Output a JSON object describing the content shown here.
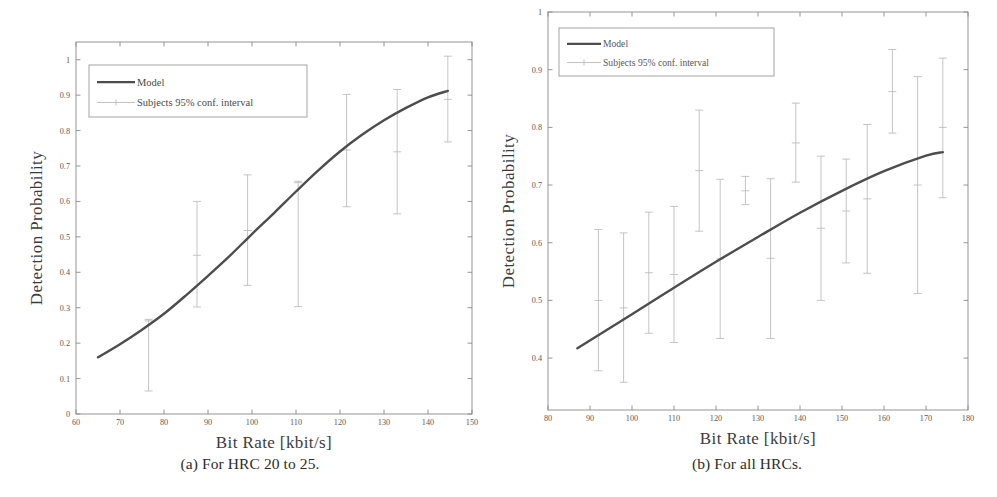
{
  "figure": {
    "panels": [
      {
        "id": "panel-a",
        "caption": "(a) For HRC 20 to 25.",
        "caption_index": "(a)",
        "caption_text": "For HRC 20 to 25."
      },
      {
        "id": "panel-b",
        "caption": "(b) For all HRCs.",
        "caption_index": "(b)",
        "caption_text": "For all HRCs."
      }
    ],
    "colors": {
      "model_line": "#4d4d4d",
      "errorbar": "#b9b9b9",
      "axis": "#8a8a8a",
      "text": "#4a4a4a",
      "background": "#ffffff",
      "legend_border": "#9a9a9a"
    }
  },
  "chart_data": [
    {
      "type": "line",
      "id": "chart-a",
      "title": "(a) For HRC 20 to 25.",
      "xlabel": "Bit Rate [kbit/s]",
      "ylabel": "Detection Probability",
      "xlim": [
        60,
        150
      ],
      "ylim": [
        0,
        1.05
      ],
      "xticks": [
        60,
        70,
        80,
        90,
        100,
        110,
        120,
        130,
        140,
        150
      ],
      "xtick_labels": [
        "60",
        "70",
        "80",
        "90",
        "100",
        "110",
        "120",
        "130",
        "140",
        "150"
      ],
      "yticks": [
        0,
        0.1,
        0.2,
        0.3,
        0.4,
        0.5,
        0.6,
        0.7,
        0.8,
        0.9,
        1
      ],
      "ytick_labels": [
        "0",
        "0.1",
        "0.2",
        "0.3",
        "0.4",
        "0.5",
        "0.6",
        "0.7",
        "0.8",
        "0.9",
        "1"
      ],
      "grid": false,
      "legend_position": "upper left",
      "legend": [
        "Model",
        "Subjects 95% conf. interval"
      ],
      "series": [
        {
          "name": "Model",
          "style": "line",
          "x": [
            65,
            70,
            75,
            80,
            85,
            90,
            95,
            100,
            105,
            110,
            115,
            120,
            125,
            130,
            135,
            140,
            144.5
          ],
          "values": [
            0.16,
            0.197,
            0.238,
            0.283,
            0.335,
            0.39,
            0.447,
            0.508,
            0.567,
            0.628,
            0.687,
            0.741,
            0.788,
            0.829,
            0.864,
            0.894,
            0.912
          ]
        },
        {
          "name": "Subjects 95% conf. interval",
          "style": "errorbar",
          "x": [
            76.5,
            87.5,
            99,
            110.5,
            121.5,
            133,
            144.5
          ],
          "values": [
            0.263,
            0.448,
            0.518,
            0.653,
            0.745,
            0.74,
            0.888
          ],
          "lower": [
            0.065,
            0.302,
            0.363,
            0.303,
            0.585,
            0.565,
            0.768
          ],
          "upper": [
            0.267,
            0.6,
            0.675,
            0.657,
            0.902,
            0.916,
            1.01
          ]
        }
      ]
    },
    {
      "type": "line",
      "id": "chart-b",
      "title": "(b) For all HRCs.",
      "xlabel": "Bit Rate [kbit/s]",
      "ylabel": "Detection Probability",
      "xlim": [
        80,
        180
      ],
      "ylim": [
        0.31,
        1.0
      ],
      "xticks": [
        80,
        90,
        100,
        110,
        120,
        130,
        140,
        150,
        160,
        170,
        180
      ],
      "xtick_labels": [
        "80",
        "90",
        "100",
        "110",
        "120",
        "130",
        "140",
        "150",
        "160",
        "170",
        "180"
      ],
      "yticks": [
        0.4,
        0.5,
        0.6,
        0.7,
        0.8,
        0.9,
        1
      ],
      "ytick_labels": [
        "0.4",
        "0.5",
        "0.6",
        "0.7",
        "0.8",
        "0.9",
        "1"
      ],
      "grid": false,
      "legend_position": "upper left",
      "legend": [
        "Model",
        "Subjects 95% conf. interval"
      ],
      "series": [
        {
          "name": "Model",
          "style": "line",
          "x": [
            87,
            100,
            110,
            120,
            130,
            140,
            150,
            160,
            170,
            174
          ],
          "values": [
            0.417,
            0.476,
            0.522,
            0.567,
            0.61,
            0.652,
            0.69,
            0.724,
            0.751,
            0.757
          ]
        },
        {
          "name": "Subjects 95% conf. interval",
          "style": "errorbar",
          "x": [
            92,
            98,
            104,
            110,
            116,
            121,
            127,
            133,
            139,
            145,
            151,
            156,
            162,
            168,
            174
          ],
          "values": [
            0.5,
            0.487,
            0.548,
            0.545,
            0.725,
            0.572,
            0.69,
            0.573,
            0.773,
            0.625,
            0.655,
            0.676,
            0.862,
            0.7,
            0.8
          ],
          "lower": [
            0.378,
            0.358,
            0.443,
            0.427,
            0.62,
            0.434,
            0.666,
            0.434,
            0.705,
            0.5,
            0.565,
            0.547,
            0.79,
            0.512,
            0.678
          ],
          "upper": [
            0.623,
            0.617,
            0.653,
            0.663,
            0.83,
            0.71,
            0.715,
            0.711,
            0.842,
            0.75,
            0.745,
            0.805,
            0.935,
            0.888,
            0.92
          ]
        }
      ]
    }
  ]
}
